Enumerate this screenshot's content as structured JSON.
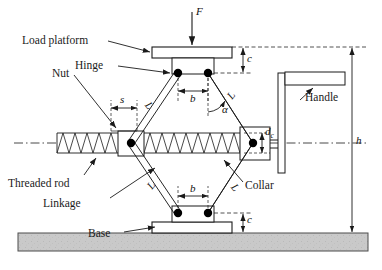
{
  "figure": {
    "background": "#ffffff",
    "line_color": "#1a1a1a",
    "ground_fill": "#c9c9c9",
    "ground_edge": "#555555",
    "joint_fill": "#000000"
  },
  "labels": {
    "load_platform": "Load platform",
    "hinge": "Hinge",
    "nut": "Nut",
    "threaded_rod": "Threaded rod",
    "linkage": "Linkage",
    "base": "Base",
    "handle": "Handle",
    "collar": "Collar"
  },
  "symbols": {
    "force": "F",
    "height": "h",
    "clearance_top": "c",
    "clearance_bottom": "c",
    "half_width_top": "b",
    "half_width_bottom": "b",
    "stroke": "s",
    "link_len_tl": "L",
    "link_len_tr": "L",
    "link_len_bl": "L",
    "link_len_br": "L",
    "angle": "α",
    "collar_dia": "d",
    "collar_dia_sub": "c"
  },
  "geometry": {
    "top_hinge_left": [
      178,
      73
    ],
    "top_hinge_right": [
      208,
      73
    ],
    "bottom_hinge_left": [
      178,
      213
    ],
    "bottom_hinge_right": [
      208,
      213
    ],
    "left_pivot": [
      131,
      143
    ],
    "right_pivot": [
      253,
      143
    ],
    "platform": {
      "x": 152,
      "y": 47,
      "w": 80,
      "h": 11
    },
    "base_block": {
      "x": 152,
      "y": 222,
      "w": 80,
      "h": 11
    },
    "nut_block": {
      "x": 118,
      "y": 131,
      "w": 26,
      "h": 25
    },
    "collar_block": {
      "x": 240,
      "y": 127,
      "w": 30,
      "h": 33
    },
    "ground": {
      "x": 18,
      "y": 233,
      "w": 350,
      "h": 18
    },
    "axis_y": 143,
    "handle_post_x": 283,
    "handle_arm": {
      "x": 285,
      "y": 73,
      "w": 60,
      "h": 12
    },
    "h_arrow_x": 352,
    "top_datum_y": 47
  }
}
